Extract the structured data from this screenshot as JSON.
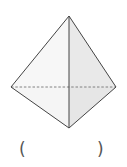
{
  "figure": {
    "type": "triangular bipyramid / tetrahedron sketch",
    "vertices": {
      "apex": [
        69,
        16
      ],
      "left": [
        11,
        87
      ],
      "right": [
        116,
        87
      ],
      "bottom": [
        69,
        128
      ]
    },
    "colors": {
      "stroke": "#444444",
      "left_face": "#f7f7f7",
      "right_face": "#e8e8e8",
      "hidden_edge": "#666666"
    }
  },
  "answer": {
    "open_paren": "(",
    "close_paren": ")",
    "blank": ""
  }
}
